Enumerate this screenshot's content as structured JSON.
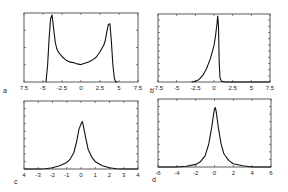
{
  "chart_data": [
    {
      "id": "a",
      "type": "line",
      "panel_label": "a",
      "title": "",
      "xlabel": "",
      "ylabel": "",
      "xlim": [
        -7.5,
        7.5
      ],
      "x_tick_labels": [
        "7.5",
        "-5",
        "-2.5",
        "0",
        "2.5",
        "5",
        "7.5"
      ],
      "x_ticks": [
        -7.5,
        -5,
        -2.5,
        0,
        2.5,
        5,
        7.5
      ],
      "ylim": [
        0,
        1
      ],
      "y_tick_count": 3,
      "grid": false,
      "series": [
        {
          "name": "a",
          "x": [
            -4.6,
            -4.4,
            -4.2,
            -4.0,
            -3.8,
            -3.6,
            -3.4,
            -3.2,
            -3.0,
            -2.5,
            -2.0,
            -1.5,
            -1.0,
            -0.5,
            0.0,
            0.5,
            1.0,
            1.5,
            2.0,
            2.5,
            3.0,
            3.2,
            3.4,
            3.6,
            3.8,
            4.0,
            4.2,
            4.4,
            4.6,
            4.8
          ],
          "values": [
            0.0,
            0.25,
            0.65,
            0.95,
            1.0,
            0.8,
            0.6,
            0.5,
            0.45,
            0.38,
            0.33,
            0.3,
            0.29,
            0.27,
            0.26,
            0.28,
            0.3,
            0.33,
            0.37,
            0.45,
            0.55,
            0.62,
            0.75,
            0.86,
            0.87,
            0.6,
            0.25,
            0.05,
            0.0,
            0.0
          ]
        }
      ]
    },
    {
      "id": "b",
      "type": "line",
      "panel_label": "b",
      "title": "",
      "xlabel": "",
      "ylabel": "",
      "xlim": [
        -7.5,
        7.5
      ],
      "x_tick_labels": [
        "-7.5",
        "-5",
        "-2.5",
        "0",
        "2.5",
        "5",
        "7.5"
      ],
      "x_ticks": [
        -7.5,
        -5,
        -2.5,
        0,
        2.5,
        5,
        7.5
      ],
      "ylim": [
        0,
        1
      ],
      "y_tick_count": 10,
      "grid": false,
      "series": [
        {
          "name": "b",
          "x": [
            -3.0,
            -2.5,
            -2.0,
            -1.5,
            -1.0,
            -0.5,
            0.0,
            0.2,
            0.4,
            0.5,
            0.6,
            0.7,
            0.8,
            1.0,
            1.5,
            7.5
          ],
          "values": [
            0.0,
            0.01,
            0.04,
            0.1,
            0.2,
            0.35,
            0.55,
            0.7,
            0.88,
            1.0,
            0.85,
            0.3,
            0.06,
            0.01,
            0.0,
            0.0
          ]
        }
      ]
    },
    {
      "id": "c",
      "type": "line",
      "panel_label": "c",
      "title": "",
      "xlabel": "",
      "ylabel": "",
      "xlim": [
        -4,
        4
      ],
      "x_tick_labels": [
        "4",
        "-3",
        "-2",
        "-1",
        "0",
        "1",
        "2",
        "3",
        "4"
      ],
      "x_ticks": [
        -4,
        -3,
        -2,
        -1,
        0,
        1,
        2,
        3,
        4
      ],
      "ylim": [
        0,
        1
      ],
      "y_tick_count": 8,
      "grid": false,
      "series": [
        {
          "name": "c",
          "x": [
            -4,
            -3,
            -2.5,
            -2,
            -1.5,
            -1,
            -0.75,
            -0.5,
            -0.3,
            -0.15,
            0.0,
            0.1,
            0.2,
            0.35,
            0.5,
            0.75,
            1.0,
            1.5,
            2.0,
            2.5,
            3.0,
            4.0
          ],
          "values": [
            0.0,
            0.0,
            0.005,
            0.02,
            0.05,
            0.1,
            0.15,
            0.25,
            0.42,
            0.6,
            0.68,
            0.72,
            0.62,
            0.45,
            0.3,
            0.18,
            0.11,
            0.05,
            0.02,
            0.005,
            0.0,
            0.0
          ]
        }
      ]
    },
    {
      "id": "d",
      "type": "line",
      "panel_label": "d",
      "title": "",
      "xlabel": "",
      "ylabel": "",
      "xlim": [
        -6,
        6
      ],
      "x_tick_labels": [
        "-6",
        "-4",
        "-2",
        "0",
        "2",
        "4",
        "6"
      ],
      "x_ticks": [
        -6,
        -4,
        -2,
        0,
        2,
        4,
        6
      ],
      "ylim": [
        0,
        1
      ],
      "y_tick_count": 8,
      "grid": false,
      "series": [
        {
          "name": "d",
          "x": [
            -6,
            -4,
            -3,
            -2,
            -1.5,
            -1,
            -0.6,
            -0.3,
            -0.1,
            0.0,
            0.1,
            0.2,
            0.4,
            0.7,
            1.0,
            1.5,
            2.0,
            3.0,
            4.0,
            6.0
          ],
          "values": [
            0.0,
            0.0,
            0.01,
            0.04,
            0.08,
            0.17,
            0.35,
            0.6,
            0.8,
            0.88,
            0.9,
            0.82,
            0.6,
            0.35,
            0.2,
            0.1,
            0.05,
            0.02,
            0.0,
            0.0
          ]
        }
      ]
    }
  ],
  "layout": {
    "panels": {
      "a": {
        "left": 24,
        "top": 13,
        "right": 138,
        "bottom": 82,
        "letter_x": 3,
        "letter_y": 93
      },
      "b": {
        "left": 158,
        "top": 14,
        "right": 270,
        "bottom": 82,
        "letter_x": 150,
        "letter_y": 93
      },
      "c": {
        "left": 24,
        "top": 101,
        "right": 138,
        "bottom": 169,
        "letter_x": 14,
        "letter_y": 184
      },
      "d": {
        "left": 158,
        "top": 99,
        "right": 271,
        "bottom": 167,
        "letter_x": 152,
        "letter_y": 182
      }
    },
    "colors": {
      "frame": "#333333",
      "curve": "#111111",
      "text": "#222222",
      "background": "#ffffff"
    }
  }
}
